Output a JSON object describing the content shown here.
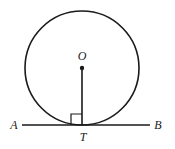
{
  "figure": {
    "kind": "geometry-diagram",
    "background_color": "#ffffff",
    "stroke_color": "#1a1a1a",
    "labels": {
      "center": "O",
      "tangent_point": "T",
      "line_left": "A",
      "line_right": "B"
    },
    "geometry": {
      "circle": {
        "cx": 82,
        "cy": 68,
        "r": 57,
        "stroke_width": 1.6
      },
      "center_dot": {
        "cx": 82,
        "cy": 68,
        "r": 2.2
      },
      "radius_segment": {
        "x1": 82,
        "y1": 68,
        "x2": 82,
        "y2": 125,
        "stroke_width": 1.6
      },
      "tangent_line": {
        "x1": 22,
        "y1": 125,
        "x2": 150,
        "y2": 125,
        "stroke_width": 1.6
      },
      "right_angle_marker": {
        "x": 71,
        "y": 114,
        "size": 11,
        "stroke_width": 1.2,
        "position": "left-of-radius-above-tangent"
      }
    },
    "label_positions": {
      "center": {
        "x": 82,
        "y": 60,
        "anchor": "middle"
      },
      "tangent_point": {
        "x": 83,
        "y": 141,
        "anchor": "middle"
      },
      "line_left": {
        "x": 14,
        "y": 129,
        "anchor": "middle"
      },
      "line_right": {
        "x": 158,
        "y": 129,
        "anchor": "middle"
      }
    }
  }
}
